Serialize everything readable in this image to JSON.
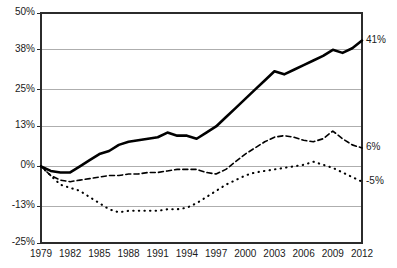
{
  "chart_data": {
    "type": "line",
    "title": "",
    "xlabel": "",
    "ylabel": "",
    "grid": true,
    "legend_position": "none",
    "ylim": [
      -25,
      50
    ],
    "xlim": [
      1979,
      2012
    ],
    "ytick_labels": [
      "50%",
      "38%",
      "25%",
      "13%",
      "0%",
      "-13%",
      "-25%"
    ],
    "ytick_values": [
      50,
      38,
      25,
      13,
      0,
      -13,
      -25
    ],
    "xtick_labels": [
      "1979",
      "1982",
      "1985",
      "1988",
      "1991",
      "1994",
      "1997",
      "2000",
      "2003",
      "2006",
      "2009",
      "2012"
    ],
    "xtick_values": [
      1979,
      1982,
      1985,
      1988,
      1991,
      1994,
      1997,
      2000,
      2003,
      2006,
      2009,
      2012
    ],
    "right_annotations": [
      {
        "label": "41%",
        "value": 41
      },
      {
        "label": "6%",
        "value": 6
      },
      {
        "label": "-5%",
        "value": -5
      }
    ],
    "x": [
      1979,
      1980,
      1981,
      1982,
      1983,
      1984,
      1985,
      1986,
      1987,
      1988,
      1989,
      1990,
      1991,
      1992,
      1993,
      1994,
      1995,
      1996,
      1997,
      1998,
      1999,
      2000,
      2001,
      2002,
      2003,
      2004,
      2005,
      2006,
      2007,
      2008,
      2009,
      2010,
      2011,
      2012
    ],
    "series": [
      {
        "name": "top-solid",
        "style": "solid",
        "color": "#000000",
        "width": 2.6,
        "end_label": "41%",
        "values": [
          0,
          -1.5,
          -2,
          -2,
          0,
          2,
          4,
          5,
          7,
          8,
          8.5,
          9,
          9.5,
          11,
          10,
          10,
          9,
          11,
          13,
          16,
          19,
          22,
          25,
          28,
          31,
          30,
          31.5,
          33,
          34.5,
          36,
          38,
          37,
          38.5,
          41
        ]
      },
      {
        "name": "middle-dashed",
        "style": "dashed",
        "color": "#000000",
        "width": 1.6,
        "end_label": "6%",
        "values": [
          0,
          -3,
          -4.5,
          -5,
          -4.5,
          -4,
          -3.5,
          -3,
          -3,
          -2.5,
          -2.5,
          -2,
          -2,
          -1.5,
          -1,
          -1,
          -1,
          -2,
          -2.5,
          -1,
          1.5,
          4,
          6,
          8,
          9.5,
          10,
          9.5,
          8.5,
          8,
          9,
          11.5,
          9,
          7,
          6
        ]
      },
      {
        "name": "bottom-dotted",
        "style": "dotted",
        "color": "#000000",
        "width": 1.6,
        "end_label": "-5%",
        "values": [
          0,
          -3,
          -6,
          -7,
          -8,
          -10,
          -12,
          -14,
          -15,
          -14.5,
          -14.5,
          -14.5,
          -14.5,
          -14,
          -14,
          -13.5,
          -12,
          -10,
          -8,
          -6,
          -4.5,
          -3,
          -2,
          -1.5,
          -1,
          -0.5,
          0,
          0.5,
          1.5,
          0.5,
          -0.5,
          -2,
          -3.5,
          -5
        ]
      }
    ]
  }
}
